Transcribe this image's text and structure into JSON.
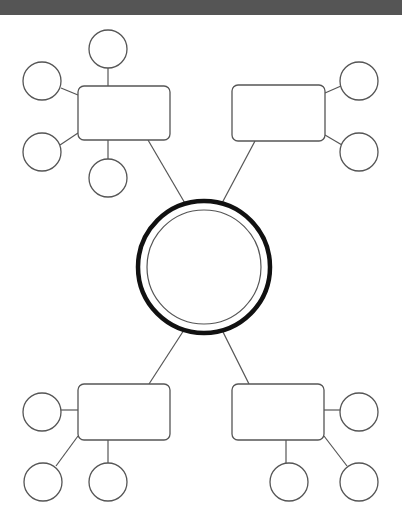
{
  "diagram": {
    "title": "",
    "type": "mind-map graphic organizer",
    "colors": {
      "topbar": "#555555",
      "stroke": "#555555",
      "center_stroke": "#111111",
      "background": "#ffffff"
    },
    "center": {
      "label": "",
      "cx": 204,
      "cy": 267,
      "r_outer": 66,
      "r_inner": 57
    },
    "branches": [
      {
        "id": "top-left",
        "label": "",
        "rect": {
          "x": 78,
          "y": 86,
          "w": 92,
          "h": 54
        },
        "link": [
          148,
          140,
          186,
          205
        ],
        "nodes": [
          {
            "label": "",
            "cx": 108,
            "cy": 49,
            "line": [
              108,
              68,
              108,
              86
            ]
          },
          {
            "label": "",
            "cx": 42,
            "cy": 81,
            "line": [
              61,
              88,
              78,
              95
            ]
          },
          {
            "label": "",
            "cx": 42,
            "cy": 152,
            "line": [
              60,
              145,
              78,
              133
            ]
          },
          {
            "label": "",
            "cx": 108,
            "cy": 178,
            "line": [
              108,
              140,
              108,
              159
            ]
          }
        ]
      },
      {
        "id": "top-right",
        "label": "",
        "rect": {
          "x": 232,
          "y": 85,
          "w": 93,
          "h": 56
        },
        "link": [
          255,
          141,
          221,
          205
        ],
        "nodes": [
          {
            "label": "",
            "cx": 359,
            "cy": 81,
            "line": [
              325,
              93,
              341,
              86
            ]
          },
          {
            "label": "",
            "cx": 359,
            "cy": 152,
            "line": [
              325,
              135,
              342,
              145
            ]
          }
        ]
      },
      {
        "id": "bottom-left",
        "label": "",
        "rect": {
          "x": 78,
          "y": 384,
          "w": 92,
          "h": 56
        },
        "link": [
          184,
          330,
          149,
          384
        ],
        "nodes": [
          {
            "label": "",
            "cx": 42,
            "cy": 412,
            "line": [
              61,
              410,
              78,
              410
            ]
          },
          {
            "label": "",
            "cx": 43,
            "cy": 482,
            "line": [
              56,
              466,
              78,
              436
            ]
          },
          {
            "label": "",
            "cx": 108,
            "cy": 482,
            "line": [
              108,
              440,
              108,
              463
            ]
          }
        ]
      },
      {
        "id": "bottom-right",
        "label": "",
        "rect": {
          "x": 232,
          "y": 384,
          "w": 92,
          "h": 56
        },
        "link": [
          222,
          330,
          249,
          384
        ],
        "nodes": [
          {
            "label": "",
            "cx": 359,
            "cy": 412,
            "line": [
              324,
              410,
              340,
              410
            ]
          },
          {
            "label": "",
            "cx": 289,
            "cy": 482,
            "line": [
              286,
              440,
              286,
              463
            ]
          },
          {
            "label": "",
            "cx": 359,
            "cy": 482,
            "line": [
              324,
              436,
              347,
              466
            ]
          }
        ]
      }
    ],
    "node_radius": 19
  }
}
